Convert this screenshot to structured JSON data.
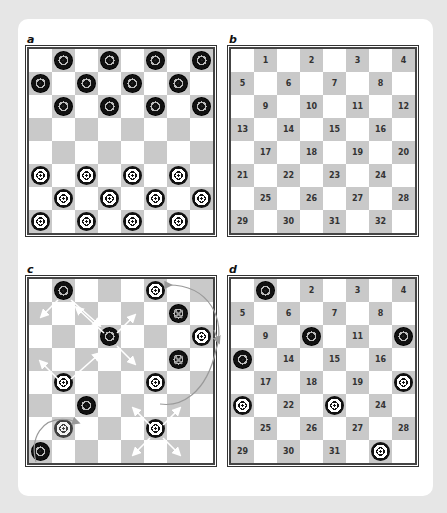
{
  "panels": {
    "a": {
      "label": "a",
      "pieces": [
        {
          "row": 0,
          "col": 1,
          "color": "black"
        },
        {
          "row": 0,
          "col": 3,
          "color": "black"
        },
        {
          "row": 0,
          "col": 5,
          "color": "black"
        },
        {
          "row": 0,
          "col": 7,
          "color": "black"
        },
        {
          "row": 1,
          "col": 0,
          "color": "black"
        },
        {
          "row": 1,
          "col": 2,
          "color": "black"
        },
        {
          "row": 1,
          "col": 4,
          "color": "black"
        },
        {
          "row": 1,
          "col": 6,
          "color": "black"
        },
        {
          "row": 2,
          "col": 1,
          "color": "black"
        },
        {
          "row": 2,
          "col": 3,
          "color": "black"
        },
        {
          "row": 2,
          "col": 5,
          "color": "black"
        },
        {
          "row": 2,
          "col": 7,
          "color": "black"
        },
        {
          "row": 5,
          "col": 0,
          "color": "white"
        },
        {
          "row": 5,
          "col": 2,
          "color": "white"
        },
        {
          "row": 5,
          "col": 4,
          "color": "white"
        },
        {
          "row": 5,
          "col": 6,
          "color": "white"
        },
        {
          "row": 6,
          "col": 1,
          "color": "white"
        },
        {
          "row": 6,
          "col": 3,
          "color": "white"
        },
        {
          "row": 6,
          "col": 5,
          "color": "white"
        },
        {
          "row": 6,
          "col": 7,
          "color": "white"
        },
        {
          "row": 7,
          "col": 0,
          "color": "white"
        },
        {
          "row": 7,
          "col": 2,
          "color": "white"
        },
        {
          "row": 7,
          "col": 4,
          "color": "white"
        },
        {
          "row": 7,
          "col": 6,
          "color": "white"
        }
      ]
    },
    "b": {
      "label": "b",
      "numbers": [
        "1",
        "2",
        "3",
        "4",
        "5",
        "6",
        "7",
        "8",
        "9",
        "10",
        "11",
        "12",
        "13",
        "14",
        "15",
        "16",
        "17",
        "18",
        "19",
        "20",
        "21",
        "22",
        "23",
        "24",
        "25",
        "26",
        "27",
        "28",
        "29",
        "30",
        "31",
        "32"
      ]
    },
    "c": {
      "label": "c",
      "pieces": [
        {
          "row": 0,
          "col": 1,
          "color": "black"
        },
        {
          "row": 2,
          "col": 3,
          "color": "black"
        },
        {
          "row": 5,
          "col": 2,
          "color": "black"
        },
        {
          "row": 7,
          "col": 0,
          "color": "black"
        },
        {
          "row": 1,
          "col": 6,
          "color": "black",
          "state": "captured"
        },
        {
          "row": 3,
          "col": 6,
          "color": "black",
          "state": "captured"
        },
        {
          "row": 0,
          "col": 5,
          "color": "white"
        },
        {
          "row": 2,
          "col": 7,
          "color": "white"
        },
        {
          "row": 4,
          "col": 1,
          "color": "white"
        },
        {
          "row": 4,
          "col": 5,
          "color": "white"
        },
        {
          "row": 6,
          "col": 1,
          "color": "white",
          "state": "ghost"
        },
        {
          "row": 6,
          "col": 5,
          "color": "white"
        }
      ],
      "annotations": "white arrows show diagonal moves; grey curved arrows show jump paths"
    },
    "d": {
      "label": "d",
      "numbers": [
        "1",
        "2",
        "3",
        "4",
        "5",
        "6",
        "7",
        "8",
        "9",
        "10",
        "11",
        "12",
        "13",
        "14",
        "15",
        "16",
        "17",
        "18",
        "19",
        "20",
        "21",
        "22",
        "23",
        "24",
        "25",
        "26",
        "27",
        "28",
        "29",
        "30",
        "31",
        "32"
      ],
      "pieces": [
        {
          "square": 1,
          "color": "black"
        },
        {
          "square": 10,
          "color": "black"
        },
        {
          "square": 12,
          "color": "black"
        },
        {
          "square": 13,
          "color": "black"
        },
        {
          "square": 20,
          "color": "white"
        },
        {
          "square": 21,
          "color": "white"
        },
        {
          "square": 23,
          "color": "white"
        },
        {
          "square": 32,
          "color": "white"
        }
      ]
    }
  },
  "colors": {
    "dark_square": "#c9c9c9",
    "light_square": "#ffffff",
    "background": "#e6e6e6",
    "card": "#ffffff"
  }
}
